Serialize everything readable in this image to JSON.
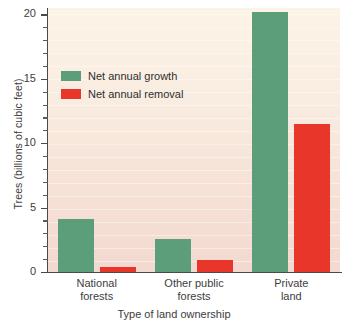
{
  "chart_data": {
    "type": "bar",
    "title": "",
    "xlabel": "Type of land ownership",
    "ylabel": "Trees (billions of cubic feet)",
    "categories": [
      "National forests",
      "Other public forests",
      "Private land"
    ],
    "category_lines": [
      [
        "National",
        "forests"
      ],
      [
        "Other public",
        "forests"
      ],
      [
        "Private",
        "land"
      ]
    ],
    "series": [
      {
        "name": "Net annual growth",
        "color": "#5d9e7a",
        "values": [
          4.1,
          2.6,
          20.2
        ]
      },
      {
        "name": "Net annual removal",
        "color": "#e8362a",
        "values": [
          0.4,
          0.9,
          11.5
        ]
      }
    ],
    "ylim": [
      0,
      20.5
    ],
    "y_major_ticks": [
      0,
      5,
      10,
      15,
      20
    ],
    "y_tick_labels": [
      "0",
      "5",
      "10",
      "15",
      "20"
    ],
    "y_minor_tick_interval": 1,
    "grid": false,
    "legend_position": "upper left",
    "plot_background_top": "#fcf4e6",
    "plot_background_bottom": "#f3d9cf",
    "axis_color": "#4a4a4a"
  },
  "axis": {
    "y_title": "Trees (billions of cubic feet)",
    "x_title": "Type of land ownership"
  },
  "legend": {
    "entries": [
      {
        "label": "Net annual growth"
      },
      {
        "label": "Net annual removal"
      }
    ]
  }
}
